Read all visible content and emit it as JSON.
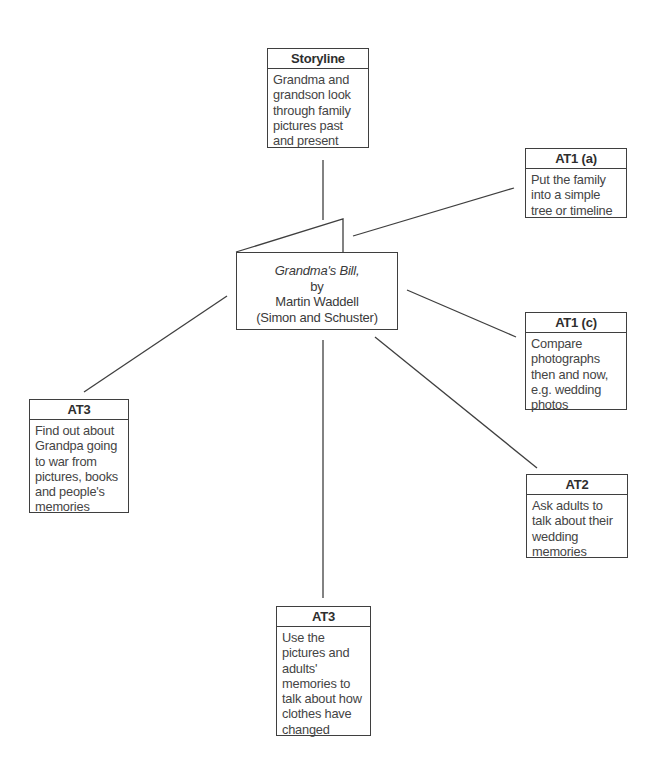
{
  "center": {
    "title": "Grandma's Bill,",
    "by": "by",
    "author": "Martin Waddell",
    "publisher": "(Simon and Schuster)"
  },
  "nodes": [
    {
      "id": "storyline",
      "heading": "Storyline",
      "body": "Grandma and\ngrandson look\nthrough family\npictures past\nand present"
    },
    {
      "id": "at1a",
      "heading": "AT1 (a)",
      "body": "Put the family\ninto a simple\ntree or timeline"
    },
    {
      "id": "at1c",
      "heading": "AT1 (c)",
      "body": "Compare\nphotographs\nthen and now,\ne.g. wedding\nphotos"
    },
    {
      "id": "at3-left",
      "heading": "AT3",
      "body": "Find out about\nGrandpa going\nto war from\npictures, books\nand people's\nmemories"
    },
    {
      "id": "at2",
      "heading": "AT2",
      "body": "Ask adults to\ntalk about their\nwedding\nmemories"
    },
    {
      "id": "at3-bottom",
      "heading": "AT3",
      "body": "Use the\npictures and\nadults'\nmemories to\ntalk about how\nclothes have\nchanged"
    }
  ],
  "colors": {
    "line": "#3f3f3f",
    "text": "#3a3a3a",
    "background": "#ffffff"
  }
}
